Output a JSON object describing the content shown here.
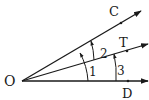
{
  "diagram": {
    "type": "angle-diagram",
    "vertex": {
      "label": "O",
      "x": 22,
      "y": 81
    },
    "rays": [
      {
        "id": "OC",
        "label": "C",
        "end": [
          141,
          11
        ],
        "point": [
          121,
          23
        ],
        "label_pos": [
          109,
          15
        ]
      },
      {
        "id": "OT",
        "label": "T",
        "end": [
          148,
          44
        ],
        "point": [
          127,
          51
        ],
        "label_pos": [
          119,
          42
        ]
      },
      {
        "id": "OD",
        "label": "D",
        "end": [
          148,
          81
        ],
        "point": [
          128,
          81
        ],
        "label_pos": [
          123,
          97
        ]
      }
    ],
    "angles": [
      {
        "label": "1",
        "between": [
          "OD",
          "OC"
        ],
        "label_pos": [
          88,
          73
        ]
      },
      {
        "label": "2",
        "between": [
          "OT",
          "OC"
        ],
        "label_pos": [
          101,
          55
        ]
      },
      {
        "label": "3",
        "between": [
          "OD",
          "OT"
        ],
        "label_pos": [
          118,
          74
        ]
      }
    ],
    "colors": {
      "stroke": "#1a1a1a",
      "background": "#ffffff"
    }
  }
}
